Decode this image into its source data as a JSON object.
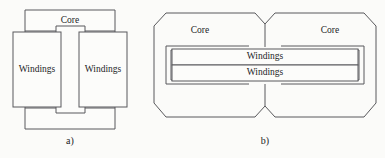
{
  "figure": {
    "background_color": "#fbfbf9",
    "line_color": "#59595c",
    "text_color": "#1d1d1f",
    "shape_fill_color": "#fcfcfa",
    "width": 385,
    "height": 158
  },
  "panel_a": {
    "caption": "a)",
    "core_label": "Core",
    "winding_left_label": "Windings",
    "winding_right_label": "Windings"
  },
  "panel_b": {
    "caption": "b)",
    "core_left_label": "Core",
    "core_right_label": "Core",
    "winding_top_label": "Windings",
    "winding_bottom_label": "Windings"
  }
}
